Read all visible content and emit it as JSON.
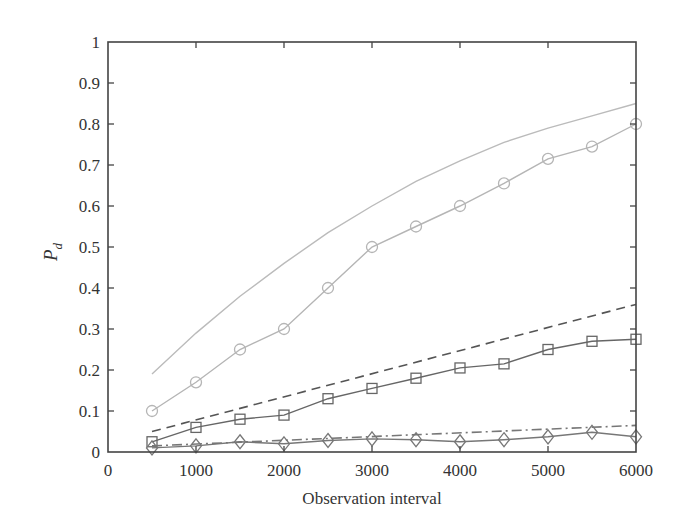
{
  "chart_data": {
    "type": "line",
    "title": "",
    "xlabel": "Observation interval",
    "ylabel": "P_d",
    "ylabel_main": "P",
    "ylabel_sub": "d",
    "xlim": [
      0,
      6000
    ],
    "ylim": [
      0,
      1
    ],
    "grid": false,
    "legend": null,
    "x_ticks": [
      0,
      1000,
      2000,
      3000,
      4000,
      5000,
      6000
    ],
    "x_tick_labels": [
      "0",
      "1000",
      "2000",
      "3000",
      "4000",
      "5000",
      "6000"
    ],
    "y_ticks": [
      0,
      0.1,
      0.2,
      0.3,
      0.4,
      0.5,
      0.6,
      0.7,
      0.8,
      0.9,
      1
    ],
    "y_tick_labels": [
      "0",
      "0.1",
      "0.2",
      "0.3",
      "0.4",
      "0.5",
      "0.6",
      "0.7",
      "0.8",
      "0.9",
      "1"
    ],
    "series": [
      {
        "name": "theory-high",
        "style": "solid",
        "marker": "none",
        "color": "#bbbbbb",
        "x": [
          500,
          1000,
          1500,
          2000,
          2500,
          3000,
          3500,
          4000,
          4500,
          5000,
          5500,
          6000
        ],
        "values": [
          0.19,
          0.29,
          0.38,
          0.46,
          0.535,
          0.6,
          0.66,
          0.71,
          0.755,
          0.79,
          0.82,
          0.85
        ]
      },
      {
        "name": "simulation-high",
        "style": "solid",
        "marker": "circle",
        "color": "#b5b5b5",
        "x": [
          500,
          1000,
          1500,
          2000,
          2500,
          3000,
          3500,
          4000,
          4500,
          5000,
          5500,
          6000
        ],
        "values": [
          0.1,
          0.17,
          0.25,
          0.3,
          0.4,
          0.5,
          0.55,
          0.6,
          0.655,
          0.715,
          0.745,
          0.8
        ]
      },
      {
        "name": "theory-mid",
        "style": "dashed",
        "marker": "none",
        "color": "#555555",
        "x": [
          500,
          6000
        ],
        "values": [
          0.05,
          0.36
        ]
      },
      {
        "name": "simulation-mid",
        "style": "solid",
        "marker": "square",
        "color": "#666666",
        "x": [
          500,
          1000,
          1500,
          2000,
          2500,
          3000,
          3500,
          4000,
          4500,
          5000,
          5500,
          6000
        ],
        "values": [
          0.025,
          0.06,
          0.08,
          0.09,
          0.13,
          0.155,
          0.18,
          0.205,
          0.215,
          0.25,
          0.27,
          0.275
        ]
      },
      {
        "name": "theory-low",
        "style": "dashdot",
        "marker": "none",
        "color": "#777777",
        "x": [
          500,
          6000
        ],
        "values": [
          0.015,
          0.065
        ]
      },
      {
        "name": "simulation-low",
        "style": "solid",
        "marker": "diamond",
        "color": "#777777",
        "x": [
          500,
          1000,
          1500,
          2000,
          2500,
          3000,
          3500,
          4000,
          4500,
          5000,
          5500,
          6000
        ],
        "values": [
          0.01,
          0.015,
          0.025,
          0.02,
          0.028,
          0.032,
          0.03,
          0.025,
          0.03,
          0.037,
          0.048,
          0.037
        ]
      }
    ]
  },
  "layout": {
    "plot_left": 108,
    "plot_top": 42,
    "plot_right": 636,
    "plot_bottom": 452,
    "axis_color": "#444444"
  }
}
